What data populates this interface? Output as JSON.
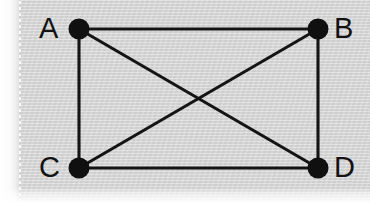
{
  "figure": {
    "kind": "graph-diagram",
    "width": 370,
    "height": 202,
    "background_color": "#d4d4d4",
    "ink_color": "#121212",
    "margin_color": "#ffffff"
  },
  "chart_data": {
    "type": "diagram",
    "title": "",
    "subtitle": "",
    "xlabel": "",
    "ylabel": "",
    "graph_type": "undirected-simple-graph",
    "vertex_count": 4,
    "edge_count": 6,
    "vertices": [
      {
        "id": "A",
        "label": "A",
        "x": 79,
        "y": 29,
        "degree": 3,
        "label_side": "left"
      },
      {
        "id": "B",
        "label": "B",
        "x": 318,
        "y": 29,
        "degree": 3,
        "label_side": "right"
      },
      {
        "id": "C",
        "label": "C",
        "x": 79,
        "y": 168,
        "degree": 3,
        "label_side": "left"
      },
      {
        "id": "D",
        "label": "D",
        "x": 318,
        "y": 168,
        "degree": 3,
        "label_side": "right"
      }
    ],
    "edges": [
      {
        "from": "A",
        "to": "B",
        "kind": "side-top"
      },
      {
        "from": "A",
        "to": "C",
        "kind": "side-left"
      },
      {
        "from": "B",
        "to": "D",
        "kind": "side-right"
      },
      {
        "from": "C",
        "to": "D",
        "kind": "side-bottom"
      },
      {
        "from": "A",
        "to": "D",
        "kind": "diagonal"
      },
      {
        "from": "B",
        "to": "C",
        "kind": "diagonal"
      }
    ],
    "crossing_point": {
      "x": 198,
      "y": 99
    },
    "node_radius": 10,
    "edge_stroke_width": 3,
    "legend": [],
    "annotations": [],
    "grid": false
  },
  "labels": {
    "a": "A",
    "b": "B",
    "c": "C",
    "d": "D"
  }
}
